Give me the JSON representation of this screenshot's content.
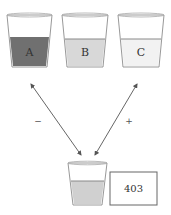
{
  "cups": [
    {
      "label": "A",
      "fill_color": "#707070",
      "level": "high"
    },
    {
      "label": "B",
      "fill_color": "#d8d8d8",
      "level": "medium"
    },
    {
      "label": "C",
      "fill_color": "#f2f2f2",
      "level": "medium"
    }
  ],
  "result_cup": {
    "fill_color": "#d0d0d0"
  },
  "arrows": {
    "left_sign": "−",
    "right_sign": "+"
  },
  "result_box": {
    "value": "403"
  }
}
